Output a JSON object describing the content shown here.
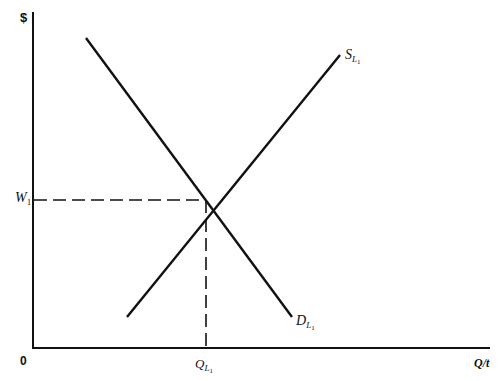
{
  "diagram": {
    "type": "supply-demand",
    "y_axis_label": "$",
    "x_axis_label": "Q/t",
    "origin_label": "0",
    "supply_label": {
      "main": "S",
      "sub": "L",
      "subsub": "1"
    },
    "demand_label": {
      "main": "D",
      "sub": "L",
      "subsub": "1"
    },
    "price_label": {
      "main": "W",
      "sub": "1"
    },
    "quantity_label": {
      "main": "Q",
      "sub": "L",
      "subsub": "1"
    },
    "lines": {
      "supply": {
        "x1": 127,
        "y1": 317,
        "x2": 340,
        "y2": 55
      },
      "demand": {
        "x1": 86,
        "y1": 38,
        "x2": 292,
        "y2": 317
      }
    },
    "equilibrium": {
      "x": 206,
      "y": 200
    },
    "colors": {
      "line": "#111111",
      "background": "#ffffff"
    }
  }
}
